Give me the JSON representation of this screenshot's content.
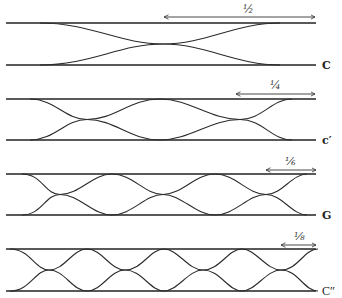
{
  "figure": {
    "panels": [
      {
        "id": "C",
        "label": "C",
        "fraction": "½",
        "top_y": 23,
        "bottom_y": 65,
        "crossings": [
          163
        ],
        "x_start": 45,
        "x_end": 275,
        "arrow_x1": 163,
        "arrow_x2": 316,
        "arrow_y": 17
      },
      {
        "id": "C1",
        "label": "c′",
        "fraction": "¼",
        "top_y": 99,
        "bottom_y": 140,
        "crossings": [
          87,
          240
        ],
        "x_start": 30,
        "x_end": 290,
        "arrow_x1": 235,
        "arrow_x2": 316,
        "arrow_y": 94
      },
      {
        "id": "G",
        "label": "G",
        "fraction": "⅙",
        "top_y": 174,
        "bottom_y": 215,
        "crossings": [
          60,
          163,
          266
        ],
        "x_start": 25,
        "x_end": 305,
        "arrow_x1": 265,
        "arrow_x2": 317,
        "arrow_y": 170
      },
      {
        "id": "C2",
        "label": "C″",
        "fraction": "⅛",
        "top_y": 249,
        "bottom_y": 291,
        "crossings": [
          49,
          125,
          203,
          281
        ],
        "x_start": 10,
        "x_end": 318,
        "arrow_x1": 280,
        "arrow_x2": 317,
        "arrow_y": 245
      }
    ],
    "rail_x1": 6,
    "rail_x2": 316
  }
}
